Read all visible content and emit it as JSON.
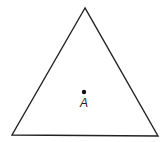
{
  "diagram": {
    "type": "geometry",
    "shape": "equilateral-triangle",
    "vertices": [
      {
        "x": 85,
        "y": 8
      },
      {
        "x": 12,
        "y": 135
      },
      {
        "x": 158,
        "y": 136
      }
    ],
    "stroke_color": "#222222",
    "points": [
      {
        "name": "A",
        "label": "A",
        "x": 84,
        "y": 92,
        "label_x": 84,
        "label_y": 107
      }
    ]
  }
}
